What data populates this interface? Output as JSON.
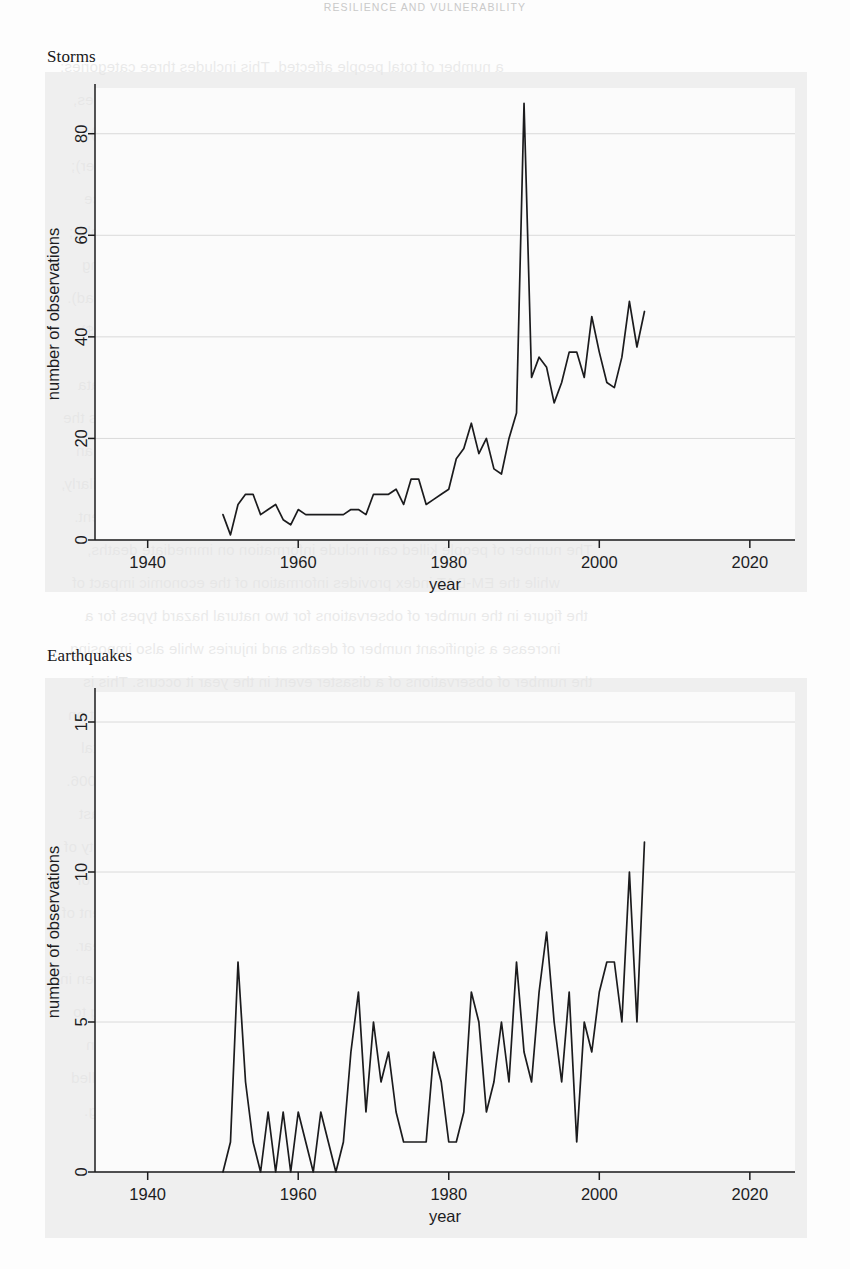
{
  "page": {
    "running_head": "RESILIENCE AND VULNERABILITY"
  },
  "bleed_text": [
    "a number of total people affected. This includes three categories:",
    "number of people injured (i.e. people suffering from physical injuries,",
    "illness requiring medical treatment as a direct result of a disaster);",
    "number of people made homeless (i.e. people needing immediate shelter);",
    "number of people affected (i.e. people requiring immediate assistance",
    "in the form of emergency which can also include displaced or evacuated people);",
    "the number of people killed (i.e. persons confirmed as dead and persons missing",
    "and presumed dead).",
    "the estimated total economic damage (in 000 US$)",
    "",
    "This methodology essentially describes losses for there is a need to define data",
    "used to estimate global figure of economic impact. Economic damage is the",
    "direct losses associated with a natural hazard impact after the event, but an",
    "indirect and longer term macro-economic losses are rarely included. Similarly,",
    "there may be a significant delay between losses incurred and measurement.",
    "The number of people killed can include information on immediate deaths,",
    "while the EM-DAT index provides information of the economic impact of",
    "the figure in the number of observations for two natural hazard types for a",
    "increase a significant number of deaths and injuries while also imposing",
    "the number of observations of a disaster event in the year it occurs. This is",
    "attributed to several climate and weather-related events, with wider impact on",
    "vulnerability (Figure 2007). Figures 4 and 5 shows all the environmental",
    "hazards reported to the EM-DAT database between 1940 and up to 2006.",
    "an increase in the number of storms has been particularly notable in the last",
    "decade. This reflects wider evidence that increasing frequency and intensity of",
    "storms and climate-related events may be an early indicator of the impacts of",
    "climate change (IPCC 2007; Stern 2006). There may also be an element of",
    "improved data reporting, but overall the trend is clear.",
    "The wider and increasing human impact of natural hazards can be seen in",
    "Figure 6, which illustrates the annual number of people affected according to",
    "the EM-DAT database. Again the trend is upwards, with the largest peaks in",
    "the number of people affected in the mid-1990s. The number of people killed",
    "displaced and dealt with and classification disasters is increasing."
  ],
  "figures": [
    {
      "title": "Storms",
      "chart_data": {
        "type": "line",
        "title": "Storms",
        "xlabel": "year",
        "ylabel": "number of observations",
        "xlim": [
          1933,
          2026
        ],
        "ylim": [
          0,
          89
        ],
        "xticks": [
          1940,
          1960,
          1980,
          2000,
          2020
        ],
        "yticks": [
          0,
          20,
          40,
          60,
          80
        ],
        "grid": true,
        "legend": "none",
        "x": [
          1950,
          1951,
          1952,
          1953,
          1954,
          1955,
          1956,
          1957,
          1958,
          1959,
          1960,
          1961,
          1962,
          1963,
          1964,
          1965,
          1966,
          1967,
          1968,
          1969,
          1970,
          1971,
          1972,
          1973,
          1974,
          1975,
          1976,
          1977,
          1978,
          1979,
          1980,
          1981,
          1982,
          1983,
          1984,
          1985,
          1986,
          1987,
          1988,
          1989,
          1990,
          1991,
          1992,
          1993,
          1994,
          1995,
          1996,
          1997,
          1998,
          1999,
          2000,
          2001,
          2002,
          2003,
          2004,
          2005,
          2006
        ],
        "values": [
          5,
          1,
          7,
          9,
          9,
          5,
          6,
          7,
          4,
          3,
          6,
          5,
          5,
          5,
          5,
          5,
          5,
          6,
          6,
          5,
          9,
          9,
          9,
          10,
          7,
          12,
          12,
          7,
          8,
          9,
          10,
          16,
          18,
          23,
          17,
          20,
          14,
          13,
          20,
          25,
          86,
          32,
          36,
          34,
          27,
          31,
          37,
          37,
          32,
          44,
          37,
          31,
          30,
          36,
          47,
          38,
          45,
          26
        ]
      }
    },
    {
      "title": "Earthquakes",
      "chart_data": {
        "type": "line",
        "title": "Earthquakes",
        "xlabel": "year",
        "ylabel": "number of observations",
        "xlim": [
          1933,
          2026
        ],
        "ylim": [
          0,
          16
        ],
        "xticks": [
          1940,
          1960,
          1980,
          2000,
          2020
        ],
        "yticks": [
          0,
          5,
          10,
          15
        ],
        "grid": true,
        "legend": "none",
        "x": [
          1950,
          1951,
          1952,
          1953,
          1954,
          1955,
          1956,
          1957,
          1958,
          1959,
          1960,
          1961,
          1962,
          1963,
          1964,
          1965,
          1966,
          1967,
          1968,
          1969,
          1970,
          1971,
          1972,
          1973,
          1974,
          1975,
          1976,
          1977,
          1978,
          1979,
          1980,
          1981,
          1982,
          1983,
          1984,
          1985,
          1986,
          1987,
          1988,
          1989,
          1990,
          1991,
          1992,
          1993,
          1994,
          1995,
          1996,
          1997,
          1998,
          1999,
          2000,
          2001,
          2002,
          2003,
          2004,
          2005,
          2006
        ],
        "values": [
          0,
          1,
          7,
          3,
          1,
          0,
          2,
          0,
          2,
          0,
          2,
          1,
          0,
          2,
          1,
          0,
          1,
          4,
          6,
          2,
          5,
          3,
          4,
          2,
          1,
          1,
          1,
          1,
          4,
          3,
          1,
          1,
          2,
          6,
          5,
          2,
          3,
          5,
          3,
          7,
          4,
          3,
          6,
          8,
          5,
          3,
          6,
          1,
          5,
          4,
          6,
          7,
          7,
          5,
          10,
          5,
          11,
          3
        ]
      }
    }
  ]
}
